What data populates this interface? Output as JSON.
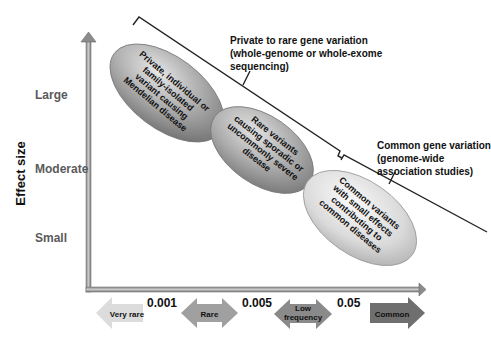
{
  "figure": {
    "y_axis": {
      "title": "Effect size",
      "ticks": [
        "Large",
        "Moderate",
        "Small"
      ]
    },
    "x_axis": {
      "thresholds": [
        "0.001",
        "0.005",
        "0.05"
      ],
      "categories": [
        {
          "label": "Very rare",
          "shape": "left-arrow",
          "color": "#d9d9d9"
        },
        {
          "label": "Rare",
          "shape": "double-arrow",
          "color": "#9c9c9c"
        },
        {
          "label": "Low frequency",
          "label_line1": "Low",
          "label_line2": "frequency",
          "shape": "double-arrow",
          "color": "#8a8a8a"
        },
        {
          "label": "Common",
          "shape": "right-arrow",
          "color": "#6e6e6e"
        }
      ]
    },
    "ellipses": [
      {
        "lines": [
          "Private, individual or",
          "family-isolated",
          "variant causing",
          "Mendelian disease"
        ],
        "fill": "#9a9a9a"
      },
      {
        "lines": [
          "Rare variants",
          "causing sporadic or",
          "uncommonly severe",
          "disease"
        ],
        "fill": "#a6a6a6"
      },
      {
        "lines": [
          "Common variants",
          "with small effects",
          "contributing to",
          "common diseases"
        ],
        "fill": "#d4d4d4"
      }
    ],
    "brackets": [
      {
        "lines": [
          "Private to rare gene variation",
          "(whole-genome or whole-exome",
          "sequencing)"
        ]
      },
      {
        "lines": [
          "Common gene variation",
          "(genome-wide",
          "association studies)"
        ]
      }
    ]
  }
}
